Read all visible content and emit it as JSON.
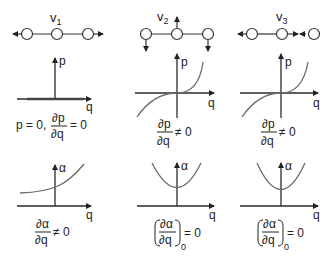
{
  "figure": {
    "columns": [
      {
        "mode_label": "v",
        "mode_index": "1",
        "mode_description": "symmetric stretch: end atoms move outward, middle atom fixed",
        "p_plot": {
          "y_axis_label": "p",
          "x_axis_label": "q",
          "curve": "p = 0 along q axis (thick line on axis)"
        },
        "p_condition": {
          "prefix": "p = 0,",
          "numerator": "∂p",
          "denominator": "∂q",
          "relation": "= 0"
        },
        "alpha_plot": {
          "y_axis_label": "α",
          "x_axis_label": "q",
          "curve": "monotonically increasing"
        },
        "alpha_condition": {
          "numerator": "∂α",
          "denominator": "∂q",
          "relation": "≠ 0",
          "subscript": ""
        }
      },
      {
        "mode_label": "v",
        "mode_index": "2",
        "mode_description": "bending: middle atom up, end atoms down",
        "p_plot": {
          "y_axis_label": "p",
          "x_axis_label": "q",
          "curve": "cubic-like, passes through origin with non-zero slope"
        },
        "p_condition": {
          "prefix": "",
          "numerator": "∂p",
          "denominator": "∂q",
          "relation": "≠ 0"
        },
        "alpha_plot": {
          "y_axis_label": "α",
          "x_axis_label": "q",
          "curve": "parabola with minimum at q = 0"
        },
        "alpha_condition": {
          "numerator": "∂α",
          "denominator": "∂q",
          "relation": "= 0",
          "subscript": "0"
        }
      },
      {
        "mode_label": "v",
        "mode_index": "3",
        "mode_description": "asymmetric stretch: left atom left, middle atom right, right atom left",
        "p_plot": {
          "y_axis_label": "p",
          "x_axis_label": "q",
          "curve": "cubic-like, passes through origin with non-zero slope"
        },
        "p_condition": {
          "prefix": "",
          "numerator": "∂p",
          "denominator": "∂q",
          "relation": "≠ 0"
        },
        "alpha_plot": {
          "y_axis_label": "α",
          "x_axis_label": "q",
          "curve": "parabola with minimum at q = 0"
        },
        "alpha_condition": {
          "numerator": "∂α",
          "denominator": "∂q",
          "relation": "= 0",
          "subscript": "0"
        }
      }
    ]
  }
}
